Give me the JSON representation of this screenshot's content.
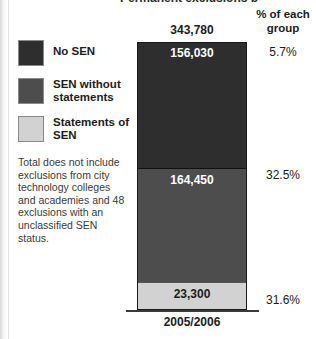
{
  "chart_data": {
    "type": "bar",
    "title": "Permanent exclusions by SEN status",
    "xlabel": "",
    "ylabel": "",
    "categories": [
      "2005/2006"
    ],
    "stacked": true,
    "total_label": "343,780",
    "total_value": 343780,
    "legend_position": "left",
    "grid": false,
    "series": [
      {
        "name": "No SEN",
        "values": [
          156030
        ],
        "value_label": "156,030",
        "percent_label": "5.7%",
        "percent_value": 5.7,
        "color": "#2e2e2e"
      },
      {
        "name": "SEN without statements",
        "values": [
          164450
        ],
        "value_label": "164,450",
        "percent_label": "32.5%",
        "percent_value": 32.5,
        "color": "#4d4d4d"
      },
      {
        "name": "Statements of SEN",
        "values": [
          23300
        ],
        "value_label": "23,300",
        "percent_label": "31.6%",
        "percent_value": 31.6,
        "color": "#d2d2d2"
      }
    ],
    "annotations": [
      "Total does not include exclusions from city technology colleges and academies and 48 exclusions with an unclassified SEN status."
    ]
  },
  "legend": {
    "items": [
      {
        "label": "No SEN",
        "swatch": "dark"
      },
      {
        "label": "SEN without statements",
        "swatch": "mid"
      },
      {
        "label": "Statements of SEN",
        "swatch": "light"
      }
    ]
  },
  "footnote": {
    "text": "Total does not include exclusions from city technology colleges and academies and 48 exclusions with an unclassified SEN status."
  },
  "percent_column": {
    "header": "% of each group",
    "values": [
      "5.7%",
      "32.5%",
      "31.6%"
    ]
  },
  "axis": {
    "category_label": "2005/2006"
  },
  "bar": {
    "total": "343,780",
    "segments": [
      "156,030",
      "164,450",
      "23,300"
    ]
  },
  "title": {
    "text": "Permanent exclusions by SEN status"
  }
}
